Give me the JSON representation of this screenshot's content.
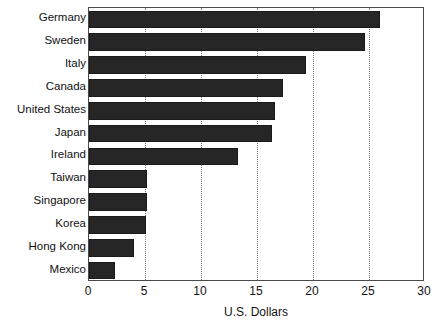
{
  "chart_data": {
    "type": "bar",
    "orientation": "horizontal",
    "title": "",
    "xlabel": "U.S. Dollars",
    "ylabel": "",
    "xlim": [
      0,
      30
    ],
    "xticks": [
      0,
      5,
      10,
      15,
      20,
      25,
      30
    ],
    "xtick_labels": [
      "0",
      "5",
      "10",
      "15",
      "20",
      "25",
      "30"
    ],
    "grid": "vertical-dotted",
    "legend": "none",
    "bar_color": "#262626",
    "categories": [
      "Germany",
      "Sweden",
      "Italy",
      "Canada",
      "United States",
      "Japan",
      "Ireland",
      "Taiwan",
      "Singapore",
      "Korea",
      "Hong Kong",
      "Mexico"
    ],
    "values": [
      26.0,
      24.6,
      19.4,
      17.3,
      16.6,
      16.3,
      13.3,
      5.2,
      5.2,
      5.1,
      4.0,
      2.3
    ]
  }
}
